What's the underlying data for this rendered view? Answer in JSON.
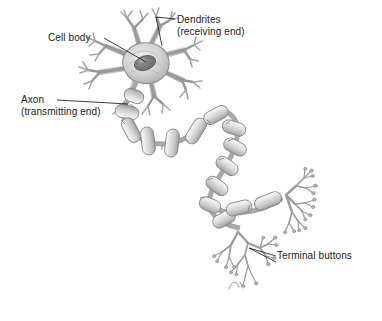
{
  "figure": {
    "style": "grayscale pencil illustration",
    "background_color": "#ffffff",
    "ink_color": "#6f6f6f",
    "text_color": "#1b1b1b",
    "shade_light": "#e8e8e8",
    "shade_mid": "#c4c4c4",
    "shade_dark": "#8c8c8c",
    "nucleus_color": "#7a7a7a"
  },
  "labels": {
    "cell_body": {
      "line1": "Cell body"
    },
    "dendrites": {
      "line1": "Dendrites",
      "line2": "(receiving end)"
    },
    "axon": {
      "line1": "Axon",
      "line2": "(transmitting end)"
    },
    "terminal_buttons": {
      "line1": "Terminal buttons"
    }
  },
  "parts": {
    "soma": "cell-body-soma",
    "nucleus": "cell-nucleus",
    "dendrite_tree": "dendrite-branches",
    "axon": "axon-fiber",
    "myelin": "myelin-sheath-segments",
    "terminal_cluster_upper": "terminal-buttons-upper",
    "terminal_cluster_lower": "terminal-buttons-lower"
  }
}
